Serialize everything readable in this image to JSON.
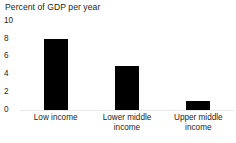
{
  "chart_data": {
    "type": "bar",
    "title": "Percent of GDP per year",
    "xlabel": "",
    "ylabel": "",
    "categories": [
      "Low income",
      "Lower middle income",
      "Upper middle income"
    ],
    "values": [
      8,
      5,
      1
    ],
    "series": [
      {
        "name": "Percent of GDP per year",
        "values": [
          8,
          5,
          1
        ]
      }
    ],
    "ylim": [
      0,
      10
    ],
    "yticks": [
      0,
      2,
      4,
      6,
      8,
      10
    ],
    "ytick_labels": [
      "0",
      "2",
      "4",
      "6",
      "8",
      "10"
    ],
    "grid": false,
    "legend": false,
    "legend_position": "none",
    "bar_color": "#000000",
    "background_color": "#ffffff",
    "axis_color": "#e8e8e8"
  },
  "axis": {
    "ticks": [
      {
        "label": "10",
        "value": 10
      },
      {
        "label": "8",
        "value": 8
      },
      {
        "label": "6",
        "value": 6
      },
      {
        "label": "4",
        "value": 4
      },
      {
        "label": "2",
        "value": 2
      },
      {
        "label": "0",
        "value": 0
      }
    ]
  },
  "categories": [
    {
      "line1": "Low income",
      "line2": ""
    },
    {
      "line1": "Lower middle",
      "line2": "income"
    },
    {
      "line1": "Upper middle",
      "line2": "income"
    }
  ]
}
